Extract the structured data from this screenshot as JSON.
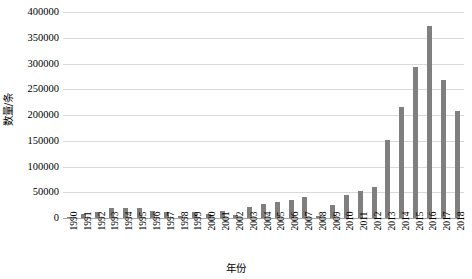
{
  "chart_data": {
    "type": "bar",
    "title": "",
    "xlabel": "年份",
    "ylabel": "数量/条",
    "ylim": [
      0,
      400000
    ],
    "ytick_labels": [
      "400000",
      "350000",
      "300000",
      "250000",
      "200000",
      "150000",
      "100000",
      "50000",
      "0"
    ],
    "ytick_values": [
      400000,
      350000,
      300000,
      250000,
      200000,
      150000,
      100000,
      50000,
      0
    ],
    "grid": true,
    "legend": "none",
    "bar_color": "#7f7f7f",
    "grid_color": "#d9d9d9",
    "categories": [
      "1990",
      "1991",
      "1992",
      "1993",
      "1994",
      "1995",
      "1996",
      "1997",
      "1998",
      "1999",
      "2000",
      "2001",
      "2002",
      "2003",
      "2004",
      "2005",
      "2006",
      "2007",
      "2008",
      "2009",
      "2010",
      "2011",
      "2012",
      "2013",
      "2014",
      "2015",
      "2016",
      "2017",
      "2018"
    ],
    "values": [
      1000,
      7000,
      12000,
      19000,
      19000,
      19000,
      14000,
      11000,
      3000,
      12000,
      7000,
      14000,
      5000,
      21000,
      27000,
      31000,
      35000,
      41000,
      3000,
      25000,
      45000,
      53000,
      61000,
      151000,
      216000,
      293000,
      373000,
      268000,
      207000
    ]
  }
}
